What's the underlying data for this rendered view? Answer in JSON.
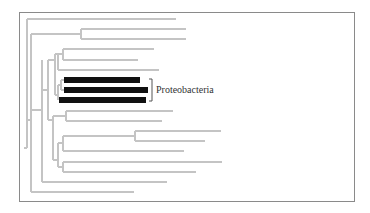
{
  "figure": {
    "type": "phylogenetic-tree",
    "colors": {
      "branch": "#c4c4c4",
      "highlight": "#111111",
      "frame": "#8a8a8a",
      "label": "#333333"
    },
    "highlighted_clade": {
      "label": "Proteobacteria",
      "leaf_count": 3
    },
    "total_leaves": 18
  }
}
